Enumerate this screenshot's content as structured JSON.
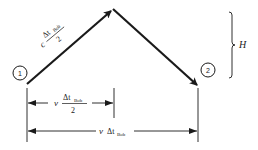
{
  "diagram": {
    "type": "light-clock path (Bob moving frame)",
    "points": {
      "start": {
        "label": "1",
        "x": 27,
        "y": 84
      },
      "apex": {
        "x": 113,
        "y": 9
      },
      "end": {
        "label": "2",
        "x": 198,
        "y": 86
      }
    },
    "labels": {
      "event1": "1",
      "event2": "2",
      "height": "H",
      "diag_coef": "c",
      "diag_num_delta": "Δt",
      "diag_num_sub": "Bob",
      "diag_den": "2",
      "half_coef": "v",
      "half_num_delta": "Δt",
      "half_num_sub": "Bob",
      "half_den": "2",
      "full_coef": "v",
      "full_delta": "Δt",
      "full_sub": "Bob"
    },
    "colors": {
      "ink": "#1a1a1a",
      "background": "#ffffff"
    }
  }
}
